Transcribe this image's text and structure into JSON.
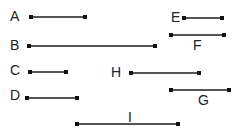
{
  "diagram": {
    "segments": [
      {
        "label": "A",
        "x1": 31,
        "x2": 85,
        "y": 17,
        "label_x": 10,
        "label_y": 9
      },
      {
        "label": "B",
        "x1": 29,
        "x2": 155,
        "y": 46,
        "label_x": 10,
        "label_y": 38
      },
      {
        "label": "C",
        "x1": 30,
        "x2": 66,
        "y": 72,
        "label_x": 10,
        "label_y": 63
      },
      {
        "label": "D",
        "x1": 27,
        "x2": 77,
        "y": 98,
        "label_x": 10,
        "label_y": 88
      },
      {
        "label": "E",
        "x1": 184,
        "x2": 222,
        "y": 18,
        "label_x": 171,
        "label_y": 10
      },
      {
        "label": "F",
        "x1": 171,
        "x2": 224,
        "y": 35,
        "label_x": 193,
        "label_y": 38
      },
      {
        "label": "G",
        "x1": 171,
        "x2": 229,
        "y": 90,
        "label_x": 198,
        "label_y": 93
      },
      {
        "label": "H",
        "x1": 131,
        "x2": 199,
        "y": 73,
        "label_x": 111,
        "label_y": 65
      },
      {
        "label": "I",
        "x1": 77,
        "x2": 178,
        "y": 124,
        "label_x": 128,
        "label_y": 110
      }
    ],
    "line_color": "#555555",
    "endpoint_color": "#111111"
  }
}
